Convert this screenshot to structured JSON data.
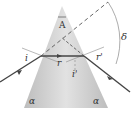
{
  "diagram": {
    "labels": {
      "apex_angle": "A",
      "incidence_angle": "i",
      "refraction_angle_first": "r",
      "refraction_angle_second": "r'",
      "emergence_angle": "i'",
      "deviation_angle": "δ",
      "base_angle_left": "α",
      "base_angle_right": "α"
    },
    "colors": {
      "prism_fill": "#c8c8c8",
      "ray": "#444444",
      "dashed": "#666666",
      "arc": "#888888"
    }
  }
}
